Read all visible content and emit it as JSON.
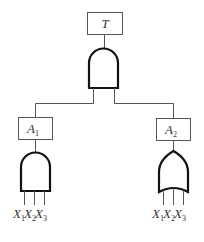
{
  "diagram": {
    "type": "fault-tree",
    "top_event": {
      "label": "T",
      "gate": "AND"
    },
    "intermediate_events": [
      {
        "label": "A",
        "subscript": "1",
        "gate": "AND",
        "inputs": [
          {
            "label": "X",
            "subscript": "1"
          },
          {
            "label": "X",
            "subscript": "2"
          },
          {
            "label": "X",
            "subscript": "3"
          }
        ]
      },
      {
        "label": "A",
        "subscript": "2",
        "gate": "OR",
        "inputs": [
          {
            "label": "X",
            "subscript": "1"
          },
          {
            "label": "X",
            "subscript": "2"
          },
          {
            "label": "X",
            "subscript": "3"
          }
        ]
      }
    ]
  },
  "colors": {
    "line": "#555555",
    "gate_stroke": "#111111",
    "text": "#333333",
    "background": "#ffffff"
  }
}
